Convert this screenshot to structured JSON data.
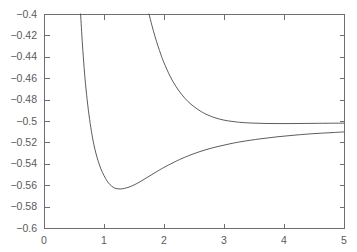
{
  "chart_data": {
    "type": "line",
    "title": "",
    "subtitle": "",
    "xlabel": "",
    "ylabel": "",
    "xlim": [
      0,
      5
    ],
    "ylim": [
      -0.6,
      -0.4
    ],
    "grid": false,
    "legend": null,
    "background_color": "#ffffff",
    "axis_color": "#6e6e6e",
    "curve_color": "#4a4a4a",
    "xticks": [
      0,
      1,
      2,
      3,
      4,
      5
    ],
    "xtick_labels": [
      "0",
      "1",
      "2",
      "3",
      "4",
      "5"
    ],
    "yticks": [
      -0.6,
      -0.58,
      -0.56,
      -0.54,
      -0.52,
      -0.5,
      -0.48,
      -0.46,
      -0.44,
      -0.42,
      -0.4
    ],
    "ytick_labels": [
      "−0.6",
      "−0.58",
      "−0.56",
      "−0.54",
      "−0.52",
      "−0.5",
      "−0.48",
      "−0.46",
      "−0.44",
      "−0.42",
      "−0.4"
    ],
    "asymptote_value": -0.5,
    "series": [
      {
        "name": "lower-curve",
        "minimum_x": 1.27,
        "minimum_y": -0.5635,
        "enters_top_at_x": 0.61,
        "x": [
          0.61,
          0.64,
          0.67,
          0.7,
          0.74,
          0.78,
          0.82,
          0.86,
          0.9,
          0.95,
          1.0,
          1.05,
          1.1,
          1.15,
          1.2,
          1.27,
          1.34,
          1.42,
          1.5,
          1.6,
          1.7,
          1.8,
          1.9,
          2.0,
          2.15,
          2.3,
          2.5,
          2.7,
          2.9,
          3.1,
          3.3,
          3.6,
          3.9,
          4.2,
          4.5,
          4.75,
          5.0
        ],
        "y": [
          -0.4,
          -0.428,
          -0.451,
          -0.47,
          -0.49,
          -0.506,
          -0.519,
          -0.529,
          -0.537,
          -0.545,
          -0.551,
          -0.556,
          -0.5595,
          -0.5618,
          -0.5631,
          -0.5635,
          -0.563,
          -0.5617,
          -0.5598,
          -0.5568,
          -0.5534,
          -0.55,
          -0.5466,
          -0.5434,
          -0.539,
          -0.535,
          -0.5305,
          -0.5268,
          -0.5238,
          -0.5213,
          -0.5192,
          -0.5167,
          -0.5147,
          -0.5131,
          -0.5118,
          -0.511,
          -0.5102
        ]
      },
      {
        "name": "upper-curve",
        "enters_top_at_x": 1.75,
        "x": [
          1.75,
          1.8,
          1.85,
          1.9,
          1.95,
          2.0,
          2.1,
          2.2,
          2.3,
          2.4,
          2.5,
          2.6,
          2.7,
          2.85,
          3.0,
          3.15,
          3.3,
          3.5,
          3.7,
          3.9,
          4.1,
          4.3,
          4.5,
          4.7,
          5.0
        ],
        "y": [
          -0.4,
          -0.411,
          -0.421,
          -0.43,
          -0.4382,
          -0.4456,
          -0.458,
          -0.4678,
          -0.4756,
          -0.4818,
          -0.4866,
          -0.4905,
          -0.4936,
          -0.497,
          -0.4992,
          -0.5005,
          -0.5014,
          -0.502,
          -0.5023,
          -0.5024,
          -0.5024,
          -0.5023,
          -0.5022,
          -0.5021,
          -0.502
        ]
      }
    ]
  },
  "plot_geometry": {
    "left": 44,
    "right": 344,
    "top": 14,
    "bottom": 228
  }
}
